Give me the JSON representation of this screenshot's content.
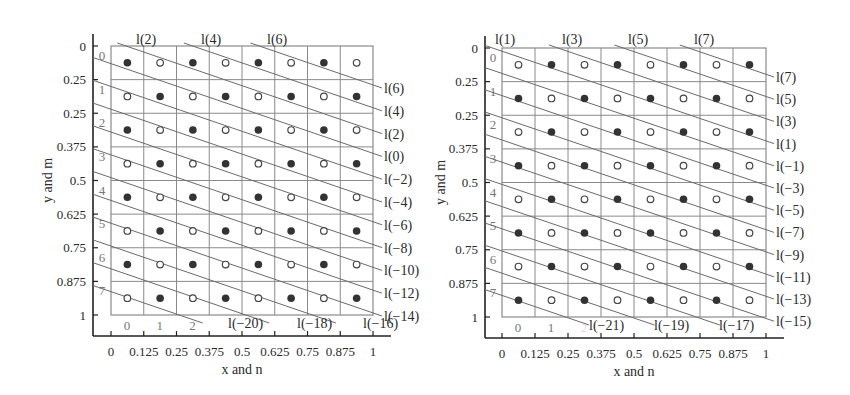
{
  "figure": {
    "panels": [
      {
        "id": "left",
        "xlabel": "x and n",
        "ylabel": "y and m",
        "x_ticks": [
          "0",
          "0.125",
          "0.25",
          "0.375",
          "0.5",
          "0.625",
          "0.75",
          "0.875",
          "1"
        ],
        "y_ticks": [
          "0",
          "0.25",
          "0.25",
          "0.375",
          "0.5",
          "0.625",
          "0.75",
          "0.875",
          "1"
        ],
        "row_labels": [
          "0",
          "1",
          "2",
          "3",
          "4",
          "5",
          "6",
          "7"
        ],
        "col_labels": [
          "0",
          "1",
          "2"
        ],
        "filled_parity": "even",
        "top_line_labels": [
          "l(2)",
          "l(4)",
          "l(6)"
        ],
        "right_line_labels": [
          "l(6)",
          "l(4)",
          "l(2)",
          "l(0)",
          "l(−2)",
          "l(−4)",
          "l(−6)",
          "l(−8)",
          "l(−10)",
          "l(−12)",
          "l(−14)"
        ],
        "bottom_line_labels": [
          "l(−20)",
          "l(−18)",
          "l(−16)"
        ]
      },
      {
        "id": "right",
        "xlabel": "x and n",
        "ylabel": "y and m",
        "x_ticks": [
          "0",
          "0.125",
          "0.25",
          "0.375",
          "0.5",
          "0.625",
          "0.75",
          "0.875",
          "1"
        ],
        "y_ticks": [
          "0",
          "0.25",
          "0.25",
          "0.375",
          "0.5",
          "0.625",
          "0.75",
          "0.875",
          "1"
        ],
        "row_labels": [
          "0",
          "1",
          "2",
          "3",
          "4",
          "5",
          "6",
          "7"
        ],
        "col_labels": [
          "0",
          "1",
          "2"
        ],
        "filled_parity": "odd",
        "top_line_labels": [
          "l(1)",
          "l(3)",
          "l(5)",
          "l(7)"
        ],
        "right_line_labels": [
          "l(7)",
          "l(5)",
          "l(3)",
          "l(1)",
          "l(−1)",
          "l(−3)",
          "l(−5)",
          "l(−7)",
          "l(−9)",
          "l(−11)",
          "l(−13)",
          "l(−15)"
        ],
        "bottom_line_labels": [
          "l(−21)",
          "l(−19)",
          "l(−17)"
        ]
      }
    ],
    "colors": {
      "grid": "#8a8a8a",
      "line": "#6a6a6a",
      "dot_filled": "#333333",
      "axis": "#222222"
    }
  },
  "chart_data": [
    {
      "type": "scatter",
      "title": "",
      "xlabel": "x and n",
      "ylabel": "y and m",
      "grid": "8x8 cells",
      "pattern": "filled dot where (row+col) is even, open dot otherwise; diagonal lines l(k) pass through filled dots",
      "lines_labels": [
        "l(2)",
        "l(4)",
        "l(6)",
        "l(0)",
        "l(-2)",
        "l(-4)",
        "l(-6)",
        "l(-8)",
        "l(-10)",
        "l(-12)",
        "l(-14)",
        "l(-16)",
        "l(-18)",
        "l(-20)"
      ],
      "xlim": [
        0,
        1
      ],
      "ylim": [
        0,
        1
      ]
    },
    {
      "type": "scatter",
      "title": "",
      "xlabel": "x and n",
      "ylabel": "y and m",
      "grid": "8x8 cells",
      "pattern": "filled dot where (row+col) is odd, open dot otherwise; diagonal lines l(k) pass through filled dots",
      "lines_labels": [
        "l(1)",
        "l(3)",
        "l(5)",
        "l(7)",
        "l(-1)",
        "l(-3)",
        "l(-5)",
        "l(-7)",
        "l(-9)",
        "l(-11)",
        "l(-13)",
        "l(-15)",
        "l(-17)",
        "l(-19)",
        "l(-21)"
      ],
      "xlim": [
        0,
        1
      ],
      "ylim": [
        0,
        1
      ]
    }
  ]
}
